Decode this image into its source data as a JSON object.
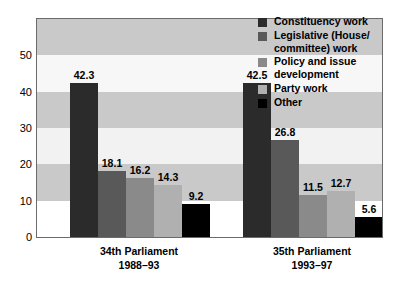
{
  "chart_data": {
    "type": "bar",
    "title": "",
    "xlabel": "",
    "ylabel": "",
    "ylim": [
      0,
      60
    ],
    "yticks": [
      0,
      10,
      20,
      30,
      40,
      50
    ],
    "grid": "horizontal-bands",
    "legend_position": "top-right",
    "categories": [
      {
        "line1": "34th Parliament",
        "line2": "1988–93"
      },
      {
        "line1": "35th Parliament",
        "line2": "1993–97"
      }
    ],
    "series": [
      {
        "name": "Constituency work",
        "color": "#2b2b2b",
        "values": [
          42.3,
          42.5
        ],
        "labels": [
          "42.3",
          "42.5"
        ]
      },
      {
        "name": "Legislative (House/ committee) work",
        "color": "#595959",
        "values": [
          18.1,
          26.8
        ],
        "labels": [
          "18.1",
          "26.8"
        ]
      },
      {
        "name": "Policy and issue development",
        "color": "#8a8a8a",
        "values": [
          16.2,
          11.5
        ],
        "labels": [
          "16.2",
          "11.5"
        ]
      },
      {
        "name": "Party work",
        "color": "#b0b0b0",
        "values": [
          14.3,
          12.7
        ],
        "labels": [
          "14.3",
          "12.7"
        ]
      },
      {
        "name": "Other",
        "color": "#000000",
        "values": [
          9.2,
          5.6
        ],
        "labels": [
          "9.2",
          "5.6"
        ]
      }
    ],
    "bands": [
      {
        "from": 0,
        "to": 10,
        "color": "#ffffff"
      },
      {
        "from": 10,
        "to": 20,
        "color": "#c9c9c9"
      },
      {
        "from": 20,
        "to": 30,
        "color": "#f2f2f2"
      },
      {
        "from": 30,
        "to": 40,
        "color": "#c9c9c9"
      },
      {
        "from": 40,
        "to": 50,
        "color": "#f7f7f7"
      },
      {
        "from": 50,
        "to": 60,
        "color": "#c9c9c9"
      }
    ]
  },
  "legend": {
    "items": [
      {
        "label": "Constituency work",
        "color": "#2b2b2b"
      },
      {
        "label": "Legislative (House/ committee) work",
        "color": "#595959"
      },
      {
        "label": "Policy and issue development",
        "color": "#8a8a8a"
      },
      {
        "label": "Party work",
        "color": "#b0b0b0"
      },
      {
        "label": "Other",
        "color": "#000000"
      }
    ]
  }
}
